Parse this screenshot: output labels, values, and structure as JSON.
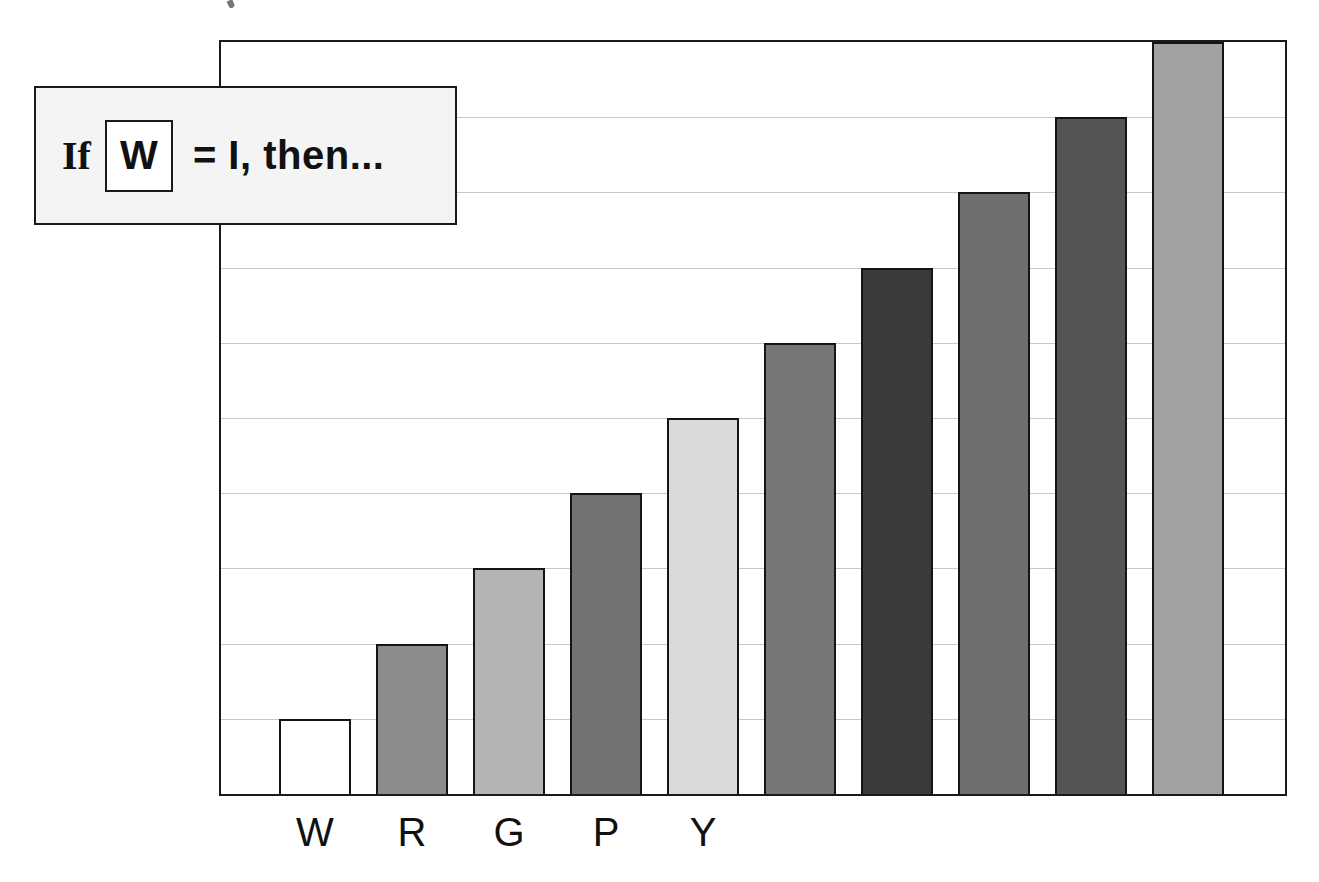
{
  "callout": {
    "prefix": "If",
    "boxed_letter": "W",
    "suffix": "=  I, then..."
  },
  "chart_data": {
    "type": "bar",
    "title": "If W = I, then...",
    "categories": [
      "W",
      "R",
      "G",
      "P",
      "Y",
      "",
      "",
      "",
      "",
      ""
    ],
    "values": [
      1,
      2,
      3,
      4,
      5,
      6,
      7,
      8,
      9,
      10
    ],
    "colors": [
      "#ffffff",
      "#8c8c8c",
      "#b4b4b4",
      "#727272",
      "#dadada",
      "#767676",
      "#3a3a3a",
      "#6f6f6f",
      "#555555",
      "#a2a2a2"
    ],
    "xlabel": "",
    "ylabel": "",
    "ylim": [
      0,
      10
    ],
    "grid": true,
    "legend": "none",
    "ytick_labels_shown": false
  }
}
